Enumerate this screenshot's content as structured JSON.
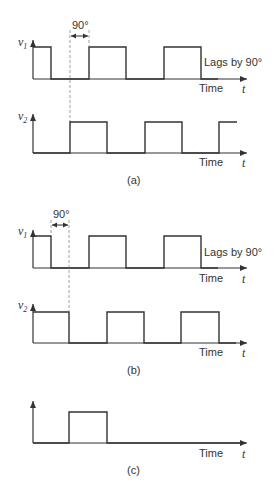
{
  "panels": {
    "a": {
      "caption": "(a)",
      "v1_label": "v",
      "v1_sub": "1",
      "v2_label": "v",
      "v2_sub": "2",
      "phase_label": "90°",
      "lag_note": "Lags by 90°",
      "time_label_1": "Time",
      "time_label_2": "Time",
      "t_label_1": "t",
      "t_label_2": "t"
    },
    "b": {
      "caption": "(b)",
      "v1_label": "v",
      "v1_sub": "1",
      "v2_label": "v",
      "v2_sub": "2",
      "phase_label": "90°",
      "lag_note": "Lags by 90°",
      "time_label_1": "Time",
      "time_label_2": "Time",
      "t_label_1": "t",
      "t_label_2": "t"
    },
    "c": {
      "caption": "(c)",
      "time_label": "Time",
      "t_label": "t"
    }
  },
  "colors": {
    "line": "#333333",
    "dashed": "#888888",
    "background": "#ffffff"
  }
}
